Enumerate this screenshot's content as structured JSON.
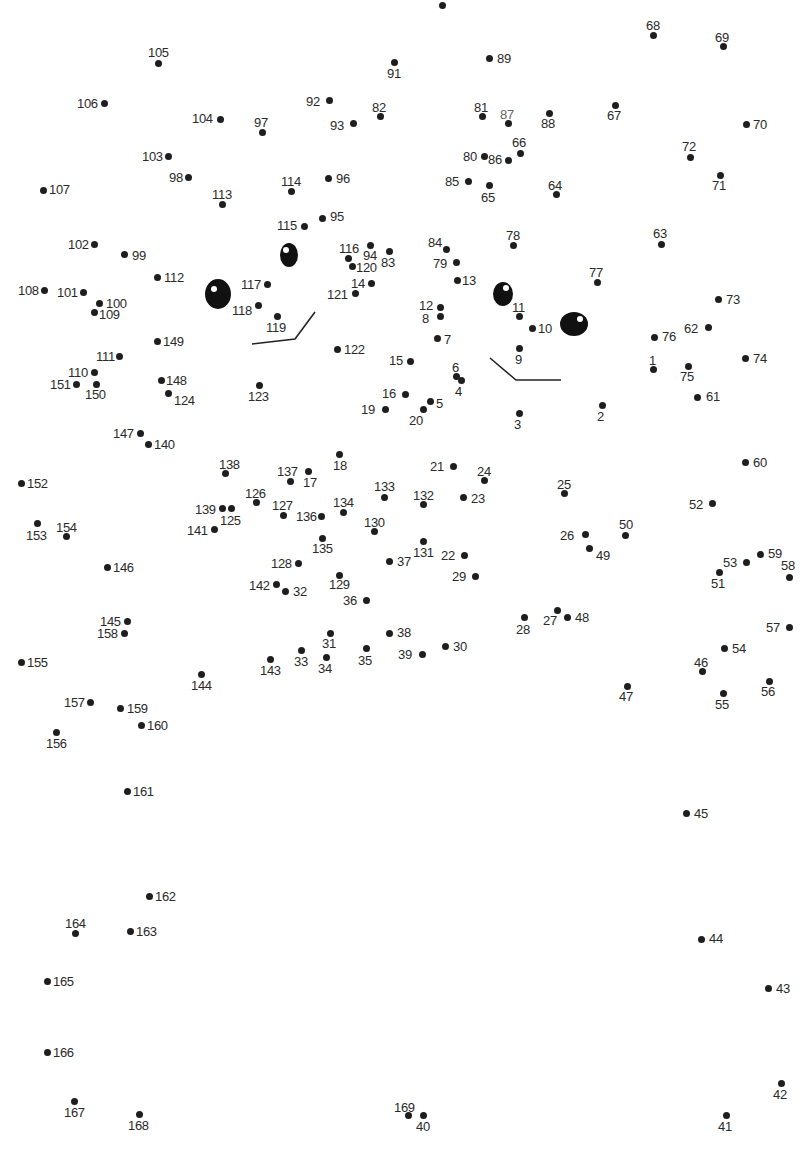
{
  "puzzle": {
    "type": "connect-the-dots",
    "total_points": 169,
    "colors": {
      "dot": "#1e1e1e",
      "label": "#2a2a2a",
      "lines": "#222222",
      "background": "#ffffff"
    },
    "points": [
      {
        "n": 1,
        "x": 653,
        "y": 369,
        "lx": 649,
        "ly": 354
      },
      {
        "n": 2,
        "x": 602,
        "y": 405,
        "lx": 597,
        "ly": 410
      },
      {
        "n": 3,
        "x": 519,
        "y": 413,
        "lx": 514,
        "ly": 418
      },
      {
        "n": 4,
        "x": 461,
        "y": 380,
        "lx": 455,
        "ly": 385
      },
      {
        "n": 5,
        "x": 430,
        "y": 401,
        "lx": 436,
        "ly": 397
      },
      {
        "n": 6,
        "x": 456,
        "y": 376,
        "lx": 452,
        "ly": 361
      },
      {
        "n": 7,
        "x": 437,
        "y": 338,
        "lx": 444,
        "ly": 333
      },
      {
        "n": 8,
        "x": 440,
        "y": 316,
        "lx": 422,
        "ly": 312
      },
      {
        "n": 9,
        "x": 519,
        "y": 348,
        "lx": 515,
        "ly": 353
      },
      {
        "n": 10,
        "x": 532,
        "y": 328,
        "lx": 538,
        "ly": 322
      },
      {
        "n": 11,
        "x": 519,
        "y": 316,
        "lx": 512,
        "ly": 301
      },
      {
        "n": 12,
        "x": 440,
        "y": 307,
        "lx": 419,
        "ly": 299
      },
      {
        "n": 13,
        "x": 457,
        "y": 280,
        "lx": 462,
        "ly": 274
      },
      {
        "n": 14,
        "x": 371,
        "y": 283,
        "lx": 351,
        "ly": 277
      },
      {
        "n": 15,
        "x": 410,
        "y": 361,
        "lx": 389,
        "ly": 354
      },
      {
        "n": 16,
        "x": 405,
        "y": 394,
        "lx": 382,
        "ly": 387
      },
      {
        "n": 17,
        "x": 308,
        "y": 471,
        "lx": 303,
        "ly": 476
      },
      {
        "n": 18,
        "x": 339,
        "y": 454,
        "lx": 333,
        "ly": 459
      },
      {
        "n": 19,
        "x": 385,
        "y": 409,
        "lx": 361,
        "ly": 403
      },
      {
        "n": 20,
        "x": 423,
        "y": 409,
        "lx": 409,
        "ly": 414
      },
      {
        "n": 21,
        "x": 453,
        "y": 466,
        "lx": 430,
        "ly": 460
      },
      {
        "n": 22,
        "x": 464,
        "y": 555,
        "lx": 441,
        "ly": 549
      },
      {
        "n": 23,
        "x": 463,
        "y": 497,
        "lx": 471,
        "ly": 492
      },
      {
        "n": 24,
        "x": 484,
        "y": 480,
        "lx": 477,
        "ly": 465
      },
      {
        "n": 25,
        "x": 564,
        "y": 493,
        "lx": 557,
        "ly": 478
      },
      {
        "n": 26,
        "x": 585,
        "y": 534,
        "lx": 560,
        "ly": 529
      },
      {
        "n": 27,
        "x": 557,
        "y": 610,
        "lx": 543,
        "ly": 614
      },
      {
        "n": 28,
        "x": 524,
        "y": 617,
        "lx": 516,
        "ly": 623
      },
      {
        "n": 29,
        "x": 475,
        "y": 576,
        "lx": 452,
        "ly": 570
      },
      {
        "n": 30,
        "x": 445,
        "y": 646,
        "lx": 453,
        "ly": 640
      },
      {
        "n": 31,
        "x": 330,
        "y": 633,
        "lx": 322,
        "ly": 637
      },
      {
        "n": 32,
        "x": 285,
        "y": 591,
        "lx": 293,
        "ly": 585
      },
      {
        "n": 33,
        "x": 301,
        "y": 650,
        "lx": 294,
        "ly": 655
      },
      {
        "n": 34,
        "x": 326,
        "y": 657,
        "lx": 318,
        "ly": 662
      },
      {
        "n": 35,
        "x": 366,
        "y": 648,
        "lx": 358,
        "ly": 654
      },
      {
        "n": 36,
        "x": 366,
        "y": 600,
        "lx": 343,
        "ly": 594
      },
      {
        "n": 37,
        "x": 389,
        "y": 561,
        "lx": 397,
        "ly": 555
      },
      {
        "n": 38,
        "x": 389,
        "y": 633,
        "lx": 397,
        "ly": 626
      },
      {
        "n": 39,
        "x": 422,
        "y": 654,
        "lx": 398,
        "ly": 648
      },
      {
        "n": 40,
        "x": 423,
        "y": 1115,
        "lx": 416,
        "ly": 1120
      },
      {
        "n": 41,
        "x": 726,
        "y": 1115,
        "lx": 718,
        "ly": 1120
      },
      {
        "n": 42,
        "x": 781,
        "y": 1083,
        "lx": 773,
        "ly": 1088
      },
      {
        "n": 43,
        "x": 768,
        "y": 988,
        "lx": 776,
        "ly": 982
      },
      {
        "n": 44,
        "x": 701,
        "y": 939,
        "lx": 709,
        "ly": 932
      },
      {
        "n": 45,
        "x": 686,
        "y": 813,
        "lx": 694,
        "ly": 807
      },
      {
        "n": 46,
        "x": 702,
        "y": 671,
        "lx": 694,
        "ly": 656
      },
      {
        "n": 47,
        "x": 627,
        "y": 686,
        "lx": 619,
        "ly": 690
      },
      {
        "n": 48,
        "x": 567,
        "y": 617,
        "lx": 575,
        "ly": 611
      },
      {
        "n": 49,
        "x": 589,
        "y": 548,
        "lx": 596,
        "ly": 549
      },
      {
        "n": 50,
        "x": 625,
        "y": 535,
        "lx": 619,
        "ly": 518
      },
      {
        "n": 51,
        "x": 719,
        "y": 572,
        "lx": 711,
        "ly": 577
      },
      {
        "n": 52,
        "x": 712,
        "y": 503,
        "lx": 689,
        "ly": 498
      },
      {
        "n": 53,
        "x": 746,
        "y": 562,
        "lx": 723,
        "ly": 556
      },
      {
        "n": 54,
        "x": 724,
        "y": 648,
        "lx": 732,
        "ly": 642
      },
      {
        "n": 55,
        "x": 723,
        "y": 693,
        "lx": 715,
        "ly": 698
      },
      {
        "n": 56,
        "x": 769,
        "y": 681,
        "lx": 761,
        "ly": 685
      },
      {
        "n": 57,
        "x": 789,
        "y": 627,
        "lx": 766,
        "ly": 621
      },
      {
        "n": 58,
        "x": 789,
        "y": 577,
        "lx": 781,
        "ly": 559
      },
      {
        "n": 59,
        "x": 760,
        "y": 554,
        "lx": 768,
        "ly": 547
      },
      {
        "n": 60,
        "x": 745,
        "y": 462,
        "lx": 753,
        "ly": 456
      },
      {
        "n": 61,
        "x": 697,
        "y": 397,
        "lx": 706,
        "ly": 390
      },
      {
        "n": 62,
        "x": 708,
        "y": 327,
        "lx": 684,
        "ly": 322
      },
      {
        "n": 63,
        "x": 661,
        "y": 244,
        "lx": 653,
        "ly": 227
      },
      {
        "n": 64,
        "x": 556,
        "y": 194,
        "lx": 548,
        "ly": 179
      },
      {
        "n": 65,
        "x": 489,
        "y": 185,
        "lx": 481,
        "ly": 191
      },
      {
        "n": 66,
        "x": 520,
        "y": 153,
        "lx": 512,
        "ly": 136
      },
      {
        "n": 67,
        "x": 615,
        "y": 105,
        "lx": 607,
        "ly": 109
      },
      {
        "n": 68,
        "x": 653,
        "y": 35,
        "lx": 646,
        "ly": 19
      },
      {
        "n": 69,
        "x": 723,
        "y": 46,
        "lx": 715,
        "ly": 31
      },
      {
        "n": 70,
        "x": 746,
        "y": 124,
        "lx": 753,
        "ly": 118
      },
      {
        "n": 71,
        "x": 720,
        "y": 175,
        "lx": 712,
        "ly": 179
      },
      {
        "n": 72,
        "x": 690,
        "y": 157,
        "lx": 682,
        "ly": 140
      },
      {
        "n": 73,
        "x": 718,
        "y": 299,
        "lx": 726,
        "ly": 293
      },
      {
        "n": 74,
        "x": 745,
        "y": 358,
        "lx": 753,
        "ly": 352
      },
      {
        "n": 75,
        "x": 688,
        "y": 366,
        "lx": 680,
        "ly": 370
      },
      {
        "n": 76,
        "x": 654,
        "y": 337,
        "lx": 662,
        "ly": 330
      },
      {
        "n": 77,
        "x": 597,
        "y": 282,
        "lx": 589,
        "ly": 266
      },
      {
        "n": 78,
        "x": 513,
        "y": 245,
        "lx": 506,
        "ly": 229
      },
      {
        "n": 79,
        "x": 456,
        "y": 262,
        "lx": 433,
        "ly": 257
      },
      {
        "n": 80,
        "x": 484,
        "y": 156,
        "lx": 463,
        "ly": 150
      },
      {
        "n": 81,
        "x": 482,
        "y": 116,
        "lx": 474,
        "ly": 101
      },
      {
        "n": 82,
        "x": 380,
        "y": 116,
        "lx": 372,
        "ly": 101
      },
      {
        "n": 83,
        "x": 389,
        "y": 251,
        "lx": 381,
        "ly": 256
      },
      {
        "n": 84,
        "x": 446,
        "y": 249,
        "lx": 428,
        "ly": 236
      },
      {
        "n": 85,
        "x": 468,
        "y": 181,
        "lx": 445,
        "ly": 175
      },
      {
        "n": 86,
        "x": 508,
        "y": 160,
        "lx": 488,
        "ly": 153
      },
      {
        "n": 87,
        "x": 508,
        "y": 123,
        "lx": 500,
        "ly": 108,
        "gray": true
      },
      {
        "n": 88,
        "x": 549,
        "y": 113,
        "lx": 541,
        "ly": 117
      },
      {
        "n": 89,
        "x": 489,
        "y": 58,
        "lx": 497,
        "ly": 52
      },
      {
        "n": 90,
        "x": 442,
        "y": 5,
        "lx": 0,
        "ly": 0,
        "label_hidden": true
      },
      {
        "n": 91,
        "x": 394,
        "y": 62,
        "lx": 387,
        "ly": 67
      },
      {
        "n": 92,
        "x": 329,
        "y": 100,
        "lx": 306,
        "ly": 95
      },
      {
        "n": 93,
        "x": 353,
        "y": 123,
        "lx": 330,
        "ly": 119
      },
      {
        "n": 94,
        "x": 370,
        "y": 245,
        "lx": 363,
        "ly": 249
      },
      {
        "n": 95,
        "x": 322,
        "y": 218,
        "lx": 330,
        "ly": 210
      },
      {
        "n": 96,
        "x": 328,
        "y": 178,
        "lx": 336,
        "ly": 172
      },
      {
        "n": 97,
        "x": 262,
        "y": 132,
        "lx": 254,
        "ly": 116
      },
      {
        "n": 98,
        "x": 188,
        "y": 177,
        "lx": 169,
        "ly": 171
      },
      {
        "n": 99,
        "x": 124,
        "y": 254,
        "lx": 132,
        "ly": 249
      },
      {
        "n": 100,
        "x": 99,
        "y": 303,
        "lx": 106,
        "ly": 297
      },
      {
        "n": 101,
        "x": 83,
        "y": 292,
        "lx": 57,
        "ly": 286
      },
      {
        "n": 102,
        "x": 94,
        "y": 244,
        "lx": 68,
        "ly": 238
      },
      {
        "n": 103,
        "x": 168,
        "y": 156,
        "lx": 142,
        "ly": 150
      },
      {
        "n": 104,
        "x": 220,
        "y": 119,
        "lx": 192,
        "ly": 112
      },
      {
        "n": 105,
        "x": 158,
        "y": 63,
        "lx": 148,
        "ly": 46
      },
      {
        "n": 106,
        "x": 104,
        "y": 103,
        "lx": 77,
        "ly": 97
      },
      {
        "n": 107,
        "x": 43,
        "y": 190,
        "lx": 49,
        "ly": 183
      },
      {
        "n": 108,
        "x": 44,
        "y": 290,
        "lx": 18,
        "ly": 284
      },
      {
        "n": 109,
        "x": 94,
        "y": 312,
        "lx": 99,
        "ly": 308
      },
      {
        "n": 110,
        "x": 94,
        "y": 372,
        "lx": 68,
        "ly": 366
      },
      {
        "n": 111,
        "x": 119,
        "y": 356,
        "lx": 96,
        "ly": 350
      },
      {
        "n": 112,
        "x": 157,
        "y": 277,
        "lx": 164,
        "ly": 271
      },
      {
        "n": 113,
        "x": 222,
        "y": 204,
        "lx": 212,
        "ly": 188
      },
      {
        "n": 114,
        "x": 291,
        "y": 191,
        "lx": 281,
        "ly": 175
      },
      {
        "n": 115,
        "x": 304,
        "y": 226,
        "lx": 277,
        "ly": 219
      },
      {
        "n": 116,
        "x": 348,
        "y": 258,
        "lx": 339,
        "ly": 242
      },
      {
        "n": 117,
        "x": 267,
        "y": 284,
        "lx": 241,
        "ly": 278
      },
      {
        "n": 118,
        "x": 258,
        "y": 305,
        "lx": 232,
        "ly": 304
      },
      {
        "n": 119,
        "x": 277,
        "y": 316,
        "lx": 266,
        "ly": 321
      },
      {
        "n": 120,
        "x": 352,
        "y": 266,
        "lx": 356,
        "ly": 261
      },
      {
        "n": 121,
        "x": 355,
        "y": 293,
        "lx": 327,
        "ly": 288
      },
      {
        "n": 122,
        "x": 337,
        "y": 349,
        "lx": 344,
        "ly": 343
      },
      {
        "n": 123,
        "x": 259,
        "y": 385,
        "lx": 248,
        "ly": 390
      },
      {
        "n": 124,
        "x": 168,
        "y": 393,
        "lx": 174,
        "ly": 394
      },
      {
        "n": 125,
        "x": 231,
        "y": 508,
        "lx": 220,
        "ly": 514
      },
      {
        "n": 126,
        "x": 256,
        "y": 502,
        "lx": 245,
        "ly": 487
      },
      {
        "n": 127,
        "x": 283,
        "y": 515,
        "lx": 272,
        "ly": 499
      },
      {
        "n": 128,
        "x": 298,
        "y": 563,
        "lx": 271,
        "ly": 557
      },
      {
        "n": 129,
        "x": 339,
        "y": 575,
        "lx": 329,
        "ly": 578
      },
      {
        "n": 130,
        "x": 374,
        "y": 531,
        "lx": 364,
        "ly": 516
      },
      {
        "n": 131,
        "x": 423,
        "y": 541,
        "lx": 413,
        "ly": 546
      },
      {
        "n": 132,
        "x": 423,
        "y": 504,
        "lx": 413,
        "ly": 489
      },
      {
        "n": 133,
        "x": 384,
        "y": 497,
        "lx": 374,
        "ly": 480
      },
      {
        "n": 134,
        "x": 343,
        "y": 512,
        "lx": 333,
        "ly": 496
      },
      {
        "n": 135,
        "x": 322,
        "y": 538,
        "lx": 312,
        "ly": 542
      },
      {
        "n": 136,
        "x": 321,
        "y": 516,
        "lx": 296,
        "ly": 510
      },
      {
        "n": 137,
        "x": 290,
        "y": 481,
        "lx": 277,
        "ly": 465
      },
      {
        "n": 138,
        "x": 225,
        "y": 473,
        "lx": 219,
        "ly": 458
      },
      {
        "n": 139,
        "x": 222,
        "y": 508,
        "lx": 195,
        "ly": 503
      },
      {
        "n": 140,
        "x": 148,
        "y": 444,
        "lx": 154,
        "ly": 438
      },
      {
        "n": 141,
        "x": 214,
        "y": 529,
        "lx": 187,
        "ly": 524
      },
      {
        "n": 142,
        "x": 276,
        "y": 584,
        "lx": 249,
        "ly": 579
      },
      {
        "n": 143,
        "x": 270,
        "y": 659,
        "lx": 260,
        "ly": 664
      },
      {
        "n": 144,
        "x": 201,
        "y": 674,
        "lx": 191,
        "ly": 679
      },
      {
        "n": 145,
        "x": 127,
        "y": 621,
        "lx": 100,
        "ly": 615
      },
      {
        "n": 146,
        "x": 107,
        "y": 567,
        "lx": 113,
        "ly": 561
      },
      {
        "n": 147,
        "x": 140,
        "y": 433,
        "lx": 113,
        "ly": 427
      },
      {
        "n": 148,
        "x": 161,
        "y": 380,
        "lx": 166,
        "ly": 374
      },
      {
        "n": 149,
        "x": 157,
        "y": 341,
        "lx": 163,
        "ly": 335
      },
      {
        "n": 150,
        "x": 96,
        "y": 384,
        "lx": 85,
        "ly": 388
      },
      {
        "n": 151,
        "x": 76,
        "y": 384,
        "lx": 50,
        "ly": 378
      },
      {
        "n": 152,
        "x": 21,
        "y": 483,
        "lx": 27,
        "ly": 477
      },
      {
        "n": 153,
        "x": 37,
        "y": 523,
        "lx": 26,
        "ly": 529
      },
      {
        "n": 154,
        "x": 66,
        "y": 536,
        "lx": 56,
        "ly": 521
      },
      {
        "n": 155,
        "x": 21,
        "y": 662,
        "lx": 27,
        "ly": 656
      },
      {
        "n": 156,
        "x": 56,
        "y": 732,
        "lx": 46,
        "ly": 737
      },
      {
        "n": 157,
        "x": 90,
        "y": 702,
        "lx": 64,
        "ly": 696
      },
      {
        "n": 158,
        "x": 124,
        "y": 633,
        "lx": 97,
        "ly": 627
      },
      {
        "n": 159,
        "x": 120,
        "y": 708,
        "lx": 127,
        "ly": 702
      },
      {
        "n": 160,
        "x": 141,
        "y": 725,
        "lx": 147,
        "ly": 719
      },
      {
        "n": 161,
        "x": 127,
        "y": 791,
        "lx": 133,
        "ly": 785
      },
      {
        "n": 162,
        "x": 149,
        "y": 896,
        "lx": 155,
        "ly": 890
      },
      {
        "n": 163,
        "x": 130,
        "y": 931,
        "lx": 136,
        "ly": 925
      },
      {
        "n": 164,
        "x": 75,
        "y": 933,
        "lx": 65,
        "ly": 917
      },
      {
        "n": 165,
        "x": 47,
        "y": 981,
        "lx": 53,
        "ly": 975
      },
      {
        "n": 166,
        "x": 47,
        "y": 1052,
        "lx": 53,
        "ly": 1046
      },
      {
        "n": 167,
        "x": 74,
        "y": 1101,
        "lx": 64,
        "ly": 1106
      },
      {
        "n": 168,
        "x": 139,
        "y": 1114,
        "lx": 128,
        "ly": 1119
      },
      {
        "n": 169,
        "x": 408,
        "y": 1115,
        "lx": 394,
        "ly": 1101
      }
    ],
    "pre_drawn": {
      "eyes": [
        {
          "name": "left-large-eye",
          "cx": 218,
          "cy": 294,
          "rx": 13,
          "ry": 15,
          "hx": 214,
          "hy": 289
        },
        {
          "name": "left-small-eye",
          "cx": 289,
          "cy": 255,
          "rx": 9,
          "ry": 12,
          "hx": 286,
          "hy": 250
        },
        {
          "name": "right-small-eye",
          "cx": 503,
          "cy": 294,
          "rx": 10,
          "ry": 12,
          "hx": 506,
          "hy": 288
        },
        {
          "name": "right-large-eye",
          "cx": 574,
          "cy": 324,
          "rx": 14,
          "ry": 12,
          "hx": 580,
          "hy": 319
        }
      ],
      "mouths": [
        {
          "name": "left-mouth",
          "points": "252,344 295,339 315,312"
        },
        {
          "name": "right-mouth",
          "points": "490,358 516,380 561,380"
        }
      ]
    }
  }
}
